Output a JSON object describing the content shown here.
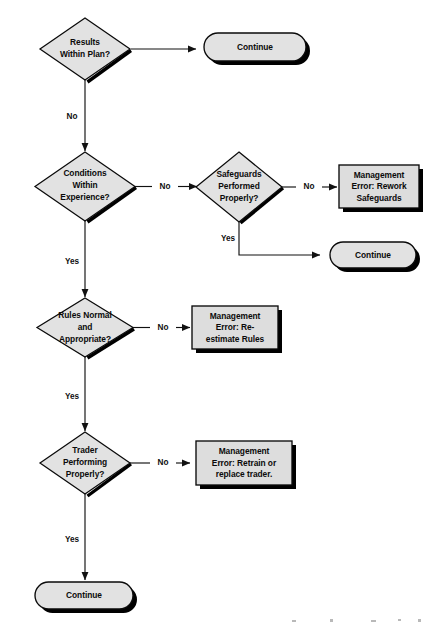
{
  "diagram": {
    "background_color": "#ffffff",
    "shape_fill": "#e2e2e2",
    "box_fill": "#dddddd",
    "line_color": "#111111",
    "shadow_color": "#000000"
  },
  "nodes": {
    "d1": {
      "type": "decision",
      "lines": [
        "Results",
        "Within Plan?"
      ]
    },
    "c1": {
      "type": "terminator",
      "lines": [
        "Continue"
      ]
    },
    "d2": {
      "type": "decision",
      "lines": [
        "Conditions",
        "Within",
        "Experience?"
      ]
    },
    "d3": {
      "type": "decision",
      "lines": [
        "Safeguards",
        "Performed",
        "Properly?"
      ]
    },
    "p1": {
      "type": "process",
      "lines": [
        "Management",
        "Error: Rework",
        "Safeguards"
      ]
    },
    "c2": {
      "type": "terminator",
      "lines": [
        "Continue"
      ]
    },
    "d4": {
      "type": "decision",
      "lines": [
        "Rules Normal",
        "and",
        "Appropriate?"
      ]
    },
    "p2": {
      "type": "process",
      "lines": [
        "Management",
        "Error: Re-",
        "estimate Rules"
      ]
    },
    "d5": {
      "type": "decision",
      "lines": [
        "Trader",
        "Performing",
        "Properly?"
      ]
    },
    "p3": {
      "type": "process",
      "lines": [
        "Management",
        "Error: Retrain or",
        "replace trader."
      ]
    },
    "c3": {
      "type": "terminator",
      "lines": [
        "Continue"
      ]
    }
  },
  "edge_labels": {
    "e1_yes_to_continue": "",
    "e1_no_down": "No",
    "e2_no_right": "No",
    "e2_yes_down": "Yes",
    "e3_no_right": "No",
    "e3_yes_down": "Yes",
    "e4_no_right": "No",
    "e4_yes_down": "Yes",
    "e5_no_right": "No",
    "e5_yes_down": "Yes"
  }
}
